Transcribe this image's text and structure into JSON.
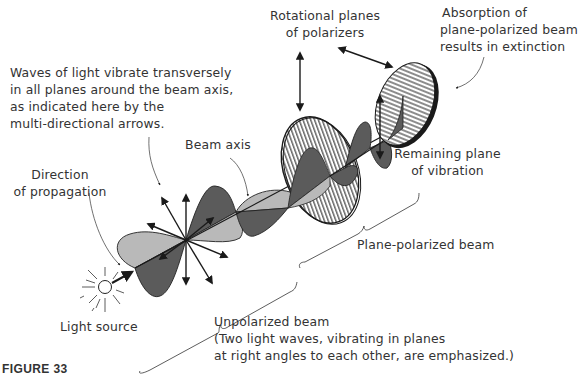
{
  "figure": {
    "caption": "FIGURE 33",
    "colors": {
      "dark_wave": "#5b5b5b",
      "light_wave": "#b9b9b9",
      "line": "#1a1a1a",
      "text": "#333333"
    }
  },
  "labels": {
    "waves_note": {
      "line1": "Waves of light vibrate transversely",
      "line2": "in all planes around the beam axis,",
      "line3": "as indicated here by the",
      "line4": "multi-directional arrows."
    },
    "rotational_planes": {
      "line1": "Rotational planes",
      "line2": "of polarizers"
    },
    "absorption": {
      "line1": "Absorption of",
      "line2": "plane-polarized beam",
      "line3": "results in extinction"
    },
    "beam_axis": "Beam axis",
    "direction": {
      "line1": "Direction",
      "line2": "of propagation"
    },
    "remaining_plane": {
      "line1": "Remaining plane",
      "line2": "of vibration"
    },
    "plane_polarized_beam": "Plane-polarized beam",
    "light_source": "Light source",
    "unpolarized": {
      "line1": "Unpolarized beam",
      "line2": "(Two light waves, vibrating in planes",
      "line3": "at right angles to each other, are emphasized.)"
    }
  }
}
